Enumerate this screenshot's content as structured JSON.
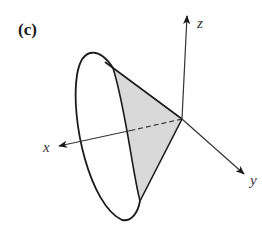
{
  "figure": {
    "panel_label": "(c)",
    "axes": {
      "x_label": "x",
      "y_label": "y",
      "z_label": "z"
    },
    "colors": {
      "stroke": "#1a1a1a",
      "shade": "#d9d9d9",
      "axis": "#333333"
    }
  }
}
